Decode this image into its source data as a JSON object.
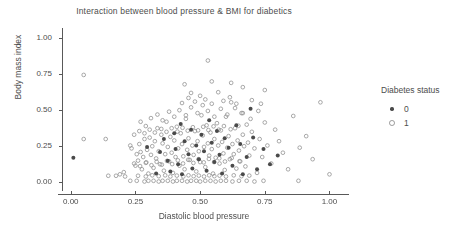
{
  "chart_data": {
    "type": "scatter",
    "title": "Interaction between blood pressure & BMI for diabetics",
    "xlabel": "Diastolic blood pressure",
    "ylabel": "Body mass index",
    "xlim": [
      -0.03,
      1.06
    ],
    "ylim": [
      -0.04,
      1.05
    ],
    "xticks": [
      "0.00",
      "0.25",
      "0.50",
      "0.75",
      "1.00"
    ],
    "xtick_values": [
      0.0,
      0.25,
      0.5,
      0.75,
      1.0
    ],
    "yticks": [
      "0.00",
      "0.25",
      "0.50",
      "0.75",
      "1.00"
    ],
    "ytick_values": [
      0.0,
      0.25,
      0.5,
      0.75,
      1.0
    ],
    "grid": false,
    "legend": {
      "title": "Diabetes status",
      "position": "right",
      "entries": [
        {
          "label": "0",
          "marker": "filled-dot",
          "color": "#4a4a4a"
        },
        {
          "label": "1",
          "marker": "open-circle",
          "color": "#9a9a9a"
        }
      ]
    },
    "colors": {
      "group0": "#4a4a4a",
      "group1": "#8c8c8c",
      "axis": "#595959",
      "text": "#4d4d4d",
      "background": "#ffffff"
    },
    "series": [
      {
        "name": "0",
        "marker": "filled-dot",
        "points": [
          [
            0.01,
            0.17
          ],
          [
            0.295,
            0.245
          ],
          [
            0.33,
            0.06
          ],
          [
            0.345,
            0.21
          ],
          [
            0.36,
            0.3
          ],
          [
            0.375,
            0.15
          ],
          [
            0.385,
            0.075
          ],
          [
            0.4,
            0.34
          ],
          [
            0.405,
            0.23
          ],
          [
            0.415,
            0.125
          ],
          [
            0.425,
            0.405
          ],
          [
            0.43,
            0.055
          ],
          [
            0.44,
            0.285
          ],
          [
            0.455,
            0.195
          ],
          [
            0.465,
            0.365
          ],
          [
            0.47,
            0.095
          ],
          [
            0.485,
            0.255
          ],
          [
            0.495,
            0.16
          ],
          [
            0.505,
            0.33
          ],
          [
            0.515,
            0.215
          ],
          [
            0.525,
            0.08
          ],
          [
            0.535,
            0.43
          ],
          [
            0.545,
            0.275
          ],
          [
            0.555,
            0.14
          ],
          [
            0.565,
            0.355
          ],
          [
            0.575,
            0.19
          ],
          [
            0.585,
            0.06
          ],
          [
            0.595,
            0.305
          ],
          [
            0.61,
            0.24
          ],
          [
            0.625,
            0.115
          ],
          [
            0.64,
            0.395
          ],
          [
            0.655,
            0.265
          ],
          [
            0.665,
            0.055
          ],
          [
            0.68,
            0.175
          ],
          [
            0.695,
            0.51
          ],
          [
            0.705,
            0.31
          ],
          [
            0.72,
            0.09
          ],
          [
            0.745,
            0.23
          ],
          [
            0.77,
            0.125
          ],
          [
            0.8,
            0.185
          ]
        ]
      },
      {
        "name": "1",
        "marker": "open-circle",
        "points": [
          [
            0.05,
            0.745
          ],
          [
            0.05,
            0.3
          ],
          [
            0.135,
            0.3
          ],
          [
            0.19,
            0.055
          ],
          [
            0.205,
            0.07
          ],
          [
            0.23,
            0.255
          ],
          [
            0.235,
            0.235
          ],
          [
            0.25,
            0.115
          ],
          [
            0.255,
            0.195
          ],
          [
            0.26,
            0.15
          ],
          [
            0.265,
            0.265
          ],
          [
            0.27,
            0.21
          ],
          [
            0.275,
            0.09
          ],
          [
            0.28,
            0.175
          ],
          [
            0.285,
            0.3
          ],
          [
            0.29,
            0.135
          ],
          [
            0.295,
            0.225
          ],
          [
            0.3,
            0.06
          ],
          [
            0.305,
            0.31
          ],
          [
            0.31,
            0.19
          ],
          [
            0.315,
            0.25
          ],
          [
            0.32,
            0.1
          ],
          [
            0.325,
            0.285
          ],
          [
            0.33,
            0.165
          ],
          [
            0.335,
            0.375
          ],
          [
            0.34,
            0.215
          ],
          [
            0.345,
            0.125
          ],
          [
            0.35,
            0.33
          ],
          [
            0.355,
            0.27
          ],
          [
            0.36,
            0.08
          ],
          [
            0.365,
            0.195
          ],
          [
            0.37,
            0.42
          ],
          [
            0.375,
            0.245
          ],
          [
            0.38,
            0.145
          ],
          [
            0.385,
            0.315
          ],
          [
            0.39,
            0.205
          ],
          [
            0.395,
            0.065
          ],
          [
            0.4,
            0.29
          ],
          [
            0.405,
            0.175
          ],
          [
            0.41,
            0.385
          ],
          [
            0.415,
            0.235
          ],
          [
            0.42,
            0.115
          ],
          [
            0.425,
            0.34
          ],
          [
            0.43,
            0.265
          ],
          [
            0.435,
            0.18
          ],
          [
            0.44,
            0.09
          ],
          [
            0.445,
            0.44
          ],
          [
            0.45,
            0.225
          ],
          [
            0.455,
            0.305
          ],
          [
            0.46,
            0.155
          ],
          [
            0.465,
            0.62
          ],
          [
            0.47,
            0.255
          ],
          [
            0.475,
            0.19
          ],
          [
            0.48,
            0.355
          ],
          [
            0.485,
            0.075
          ],
          [
            0.49,
            0.285
          ],
          [
            0.495,
            0.215
          ],
          [
            0.5,
            0.14
          ],
          [
            0.505,
            0.465
          ],
          [
            0.51,
            0.325
          ],
          [
            0.515,
            0.245
          ],
          [
            0.52,
            0.105
          ],
          [
            0.525,
            0.395
          ],
          [
            0.53,
            0.845
          ],
          [
            0.53,
            0.27
          ],
          [
            0.535,
            0.185
          ],
          [
            0.54,
            0.345
          ],
          [
            0.545,
            0.23
          ],
          [
            0.55,
            0.06
          ],
          [
            0.555,
            0.3
          ],
          [
            0.56,
            0.17
          ],
          [
            0.565,
            0.41
          ],
          [
            0.57,
            0.255
          ],
          [
            0.575,
            0.13
          ],
          [
            0.58,
            0.36
          ],
          [
            0.585,
            0.28
          ],
          [
            0.59,
            0.2
          ],
          [
            0.595,
            0.085
          ],
          [
            0.6,
            0.455
          ],
          [
            0.605,
            0.24
          ],
          [
            0.61,
            0.32
          ],
          [
            0.615,
            0.16
          ],
          [
            0.62,
            0.555
          ],
          [
            0.625,
            0.265
          ],
          [
            0.63,
            0.195
          ],
          [
            0.635,
            0.375
          ],
          [
            0.64,
            0.095
          ],
          [
            0.645,
            0.29
          ],
          [
            0.65,
            0.22
          ],
          [
            0.655,
            0.145
          ],
          [
            0.66,
            0.48
          ],
          [
            0.665,
            0.33
          ],
          [
            0.67,
            0.25
          ],
          [
            0.675,
            0.11
          ],
          [
            0.68,
            0.4
          ],
          [
            0.685,
            0.275
          ],
          [
            0.69,
            0.185
          ],
          [
            0.7,
            0.35
          ],
          [
            0.71,
            0.235
          ],
          [
            0.72,
            0.065
          ],
          [
            0.73,
            0.3
          ],
          [
            0.74,
            0.175
          ],
          [
            0.75,
            0.415
          ],
          [
            0.76,
            0.255
          ],
          [
            0.775,
            0.13
          ],
          [
            0.79,
            0.365
          ],
          [
            0.805,
            0.285
          ],
          [
            0.82,
            0.205
          ],
          [
            0.84,
            0.09
          ],
          [
            0.86,
            0.46
          ],
          [
            0.885,
            0.24
          ],
          [
            0.91,
            0.32
          ],
          [
            0.935,
            0.16
          ],
          [
            0.965,
            0.555
          ],
          [
            1.0,
            0.055
          ],
          [
            0.23,
            0.01
          ],
          [
            0.255,
            0.01
          ],
          [
            0.285,
            0.005
          ],
          [
            0.3,
            0.01
          ],
          [
            0.32,
            0.01
          ],
          [
            0.34,
            0.005
          ],
          [
            0.355,
            0.01
          ],
          [
            0.375,
            0.01
          ],
          [
            0.395,
            0.005
          ],
          [
            0.41,
            0.01
          ],
          [
            0.43,
            0.01
          ],
          [
            0.45,
            0.005
          ],
          [
            0.465,
            0.01
          ],
          [
            0.485,
            0.01
          ],
          [
            0.5,
            0.005
          ],
          [
            0.52,
            0.01
          ],
          [
            0.54,
            0.01
          ],
          [
            0.56,
            0.005
          ],
          [
            0.58,
            0.01
          ],
          [
            0.6,
            0.01
          ],
          [
            0.625,
            0.005
          ],
          [
            0.65,
            0.01
          ],
          [
            0.68,
            0.01
          ],
          [
            0.71,
            0.005
          ],
          [
            0.745,
            0.01
          ],
          [
            0.88,
            0.01
          ],
          [
            0.145,
            0.045
          ],
          [
            0.175,
            0.045
          ],
          [
            0.21,
            0.04
          ],
          [
            0.43,
            0.55
          ],
          [
            0.455,
            0.585
          ],
          [
            0.48,
            0.56
          ],
          [
            0.5,
            0.6
          ],
          [
            0.52,
            0.575
          ],
          [
            0.545,
            0.545
          ],
          [
            0.57,
            0.625
          ],
          [
            0.59,
            0.565
          ],
          [
            0.615,
            0.59
          ],
          [
            0.64,
            0.545
          ],
          [
            0.665,
            0.66
          ],
          [
            0.7,
            0.57
          ],
          [
            0.735,
            0.545
          ],
          [
            0.44,
            0.68
          ],
          [
            0.545,
            0.7
          ],
          [
            0.62,
            0.69
          ],
          [
            0.75,
            0.64
          ],
          [
            0.26,
            0.045
          ],
          [
            0.29,
            0.04
          ],
          [
            0.315,
            0.048
          ],
          [
            0.34,
            0.042
          ],
          [
            0.365,
            0.048
          ],
          [
            0.385,
            0.04
          ],
          [
            0.41,
            0.046
          ],
          [
            0.435,
            0.04
          ],
          [
            0.455,
            0.048
          ],
          [
            0.475,
            0.042
          ],
          [
            0.495,
            0.046
          ],
          [
            0.515,
            0.04
          ],
          [
            0.535,
            0.048
          ],
          [
            0.555,
            0.042
          ],
          [
            0.575,
            0.046
          ],
          [
            0.6,
            0.04
          ],
          [
            0.63,
            0.048
          ],
          [
            0.66,
            0.042
          ],
          [
            0.69,
            0.046
          ],
          [
            0.27,
            0.42
          ],
          [
            0.29,
            0.39
          ],
          [
            0.31,
            0.445
          ],
          [
            0.335,
            0.47
          ],
          [
            0.355,
            0.43
          ],
          [
            0.38,
            0.49
          ],
          [
            0.4,
            0.455
          ],
          [
            0.42,
            0.5
          ],
          [
            0.445,
            0.465
          ],
          [
            0.465,
            0.52
          ],
          [
            0.49,
            0.48
          ],
          [
            0.51,
            0.535
          ],
          [
            0.53,
            0.495
          ],
          [
            0.555,
            0.455
          ],
          [
            0.58,
            0.51
          ],
          [
            0.605,
            0.47
          ],
          [
            0.635,
            0.515
          ],
          [
            0.665,
            0.48
          ],
          [
            0.695,
            0.44
          ],
          [
            0.725,
            0.495
          ],
          [
            0.245,
            0.33
          ],
          [
            0.265,
            0.355
          ],
          [
            0.285,
            0.34
          ],
          [
            0.305,
            0.365
          ],
          [
            0.325,
            0.345
          ],
          [
            0.35,
            0.37
          ],
          [
            0.37,
            0.35
          ],
          [
            0.39,
            0.375
          ],
          [
            0.412,
            0.352
          ],
          [
            0.432,
            0.378
          ],
          [
            0.452,
            0.358
          ],
          [
            0.472,
            0.382
          ],
          [
            0.492,
            0.36
          ],
          [
            0.512,
            0.385
          ],
          [
            0.532,
            0.362
          ],
          [
            0.552,
            0.388
          ],
          [
            0.572,
            0.365
          ],
          [
            0.592,
            0.39
          ],
          [
            0.618,
            0.368
          ],
          [
            0.648,
            0.392
          ],
          [
            0.245,
            0.13
          ],
          [
            0.268,
            0.112
          ],
          [
            0.292,
            0.138
          ],
          [
            0.312,
            0.118
          ],
          [
            0.332,
            0.142
          ],
          [
            0.352,
            0.122
          ],
          [
            0.372,
            0.148
          ],
          [
            0.392,
            0.126
          ],
          [
            0.414,
            0.152
          ],
          [
            0.434,
            0.13
          ],
          [
            0.454,
            0.156
          ],
          [
            0.474,
            0.134
          ],
          [
            0.494,
            0.16
          ],
          [
            0.514,
            0.138
          ],
          [
            0.534,
            0.162
          ],
          [
            0.554,
            0.14
          ],
          [
            0.574,
            0.166
          ],
          [
            0.596,
            0.144
          ],
          [
            0.622,
            0.168
          ],
          [
            0.652,
            0.146
          ]
        ]
      }
    ]
  }
}
